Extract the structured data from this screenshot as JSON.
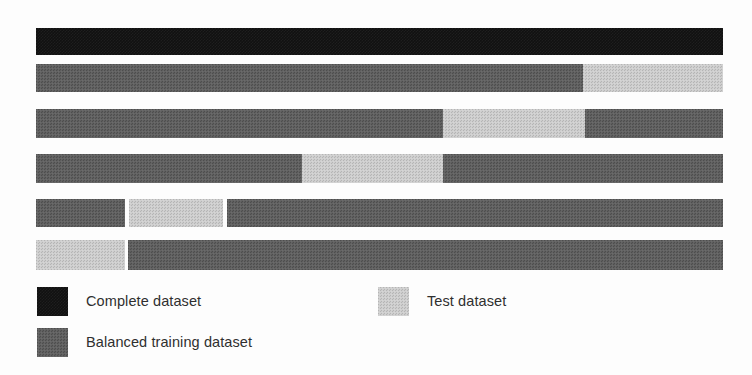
{
  "figure": {
    "title": "",
    "background_color": "#fdfdfd",
    "width": 752,
    "height": 375
  },
  "colors": {
    "complete": "#111111",
    "balanced_training": "#5d5d5d",
    "test": "#cccccc"
  },
  "legend": {
    "position": "bottom-left",
    "items": [
      {
        "key": "complete",
        "label": "Complete dataset",
        "color": "#111111"
      },
      {
        "key": "test",
        "label": "Test dataset",
        "color": "#cccccc"
      },
      {
        "key": "balanced_training",
        "label": "Balanced training dataset",
        "color": "#5d5d5d"
      }
    ]
  },
  "chart_data": {
    "type": "bar",
    "subtype": "stacked-horizontal-cross-validation-folds",
    "title": "",
    "subtitle": "",
    "xlabel": "",
    "ylabel": "",
    "grid": false,
    "legend_position": "bottom-left",
    "xlim": [
      36,
      723
    ],
    "categories": [
      "Complete dataset",
      "Fold 1",
      "Fold 2",
      "Fold 3",
      "Fold 4",
      "Fold 5"
    ],
    "series": [
      {
        "name": "Complete dataset",
        "color": "#111111"
      },
      {
        "name": "Balanced training dataset",
        "color": "#5d5d5d"
      },
      {
        "name": "Test dataset",
        "color": "#cccccc"
      }
    ],
    "rows": [
      {
        "name": "Complete dataset",
        "top": 28,
        "height": 27,
        "segments": [
          {
            "series": "Complete dataset",
            "type": "complete",
            "start": 36,
            "end": 723,
            "width": 687,
            "fraction": 1.0
          }
        ]
      },
      {
        "name": "Fold 1",
        "top": 64,
        "height": 28,
        "segments": [
          {
            "series": "Balanced training dataset",
            "type": "train",
            "start": 36,
            "end": 583,
            "width": 547,
            "fraction": 0.796
          },
          {
            "series": "Test dataset",
            "type": "test",
            "start": 583,
            "end": 723,
            "width": 140,
            "fraction": 0.204
          }
        ]
      },
      {
        "name": "Fold 2",
        "top": 109,
        "height": 29,
        "segments": [
          {
            "series": "Balanced training dataset",
            "type": "train",
            "start": 36,
            "end": 443,
            "width": 407,
            "fraction": 0.592
          },
          {
            "series": "Test dataset",
            "type": "test",
            "start": 443,
            "end": 585,
            "width": 142,
            "fraction": 0.207
          },
          {
            "series": "Balanced training dataset",
            "type": "train",
            "start": 585,
            "end": 723,
            "width": 138,
            "fraction": 0.201
          }
        ]
      },
      {
        "name": "Fold 3",
        "top": 154,
        "height": 29,
        "segments": [
          {
            "series": "Balanced training dataset",
            "type": "train",
            "start": 36,
            "end": 302,
            "width": 266,
            "fraction": 0.387
          },
          {
            "series": "Test dataset",
            "type": "test",
            "start": 302,
            "end": 443,
            "width": 141,
            "fraction": 0.205
          },
          {
            "series": "Balanced training dataset",
            "type": "train",
            "start": 443,
            "end": 723,
            "width": 280,
            "fraction": 0.408
          }
        ]
      },
      {
        "name": "Fold 4",
        "top": 199,
        "height": 28,
        "segments": [
          {
            "series": "Balanced training dataset",
            "type": "train",
            "start": 36,
            "end": 125,
            "width": 89,
            "fraction": 0.13
          },
          {
            "series": "Test dataset",
            "type": "test",
            "start": 129,
            "end": 223,
            "width": 94,
            "fraction": 0.137
          },
          {
            "series": "Balanced training dataset",
            "type": "train",
            "start": 227,
            "end": 723,
            "width": 496,
            "fraction": 0.722
          }
        ]
      },
      {
        "name": "Fold 5",
        "top": 240,
        "height": 30,
        "segments": [
          {
            "series": "Test dataset",
            "type": "test",
            "start": 36,
            "end": 125,
            "width": 89,
            "fraction": 0.13
          },
          {
            "series": "Balanced training dataset",
            "type": "train",
            "start": 128,
            "end": 723,
            "width": 595,
            "fraction": 0.866
          }
        ]
      }
    ]
  }
}
